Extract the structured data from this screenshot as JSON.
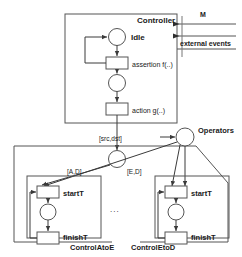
{
  "diagram": {
    "type": "hierarchical-petri-net",
    "title_visible": false,
    "colors": {
      "stroke": "#555555",
      "text": "#1a1a1a",
      "fill": "#ffffff",
      "background": "#ffffff"
    },
    "controller": {
      "box_label": "Controller",
      "places": [
        {
          "id": "idle",
          "label": "Idle",
          "shape": "circle"
        },
        {
          "id": "p2",
          "label": "",
          "shape": "circle"
        }
      ],
      "transitions": [
        {
          "id": "t-assert",
          "label": "assertion f(..)",
          "shape": "rect"
        },
        {
          "id": "t-action",
          "label": "action g(..)",
          "shape": "rect"
        }
      ]
    },
    "external": {
      "channel_top_label": "M",
      "channel_bottom_label": "external events"
    },
    "arcs": {
      "src_dst_label": "[src,dst]",
      "a_to_d_label": "[A,D]",
      "e_to_d_label": "[E,D]"
    },
    "operators": {
      "label": "Operators",
      "shape": "circle"
    },
    "mid_place": {
      "label": "",
      "shape": "circle"
    },
    "ellipsis": "...",
    "subnets": [
      {
        "id": "control-a-to-e",
        "name": "ControlAtoE",
        "start_label": "startT",
        "finish_label": "finishT",
        "place_label": ""
      },
      {
        "id": "control-e-to-d",
        "name": "ControlEtoD",
        "start_label": "startT",
        "finish_label": "finishT",
        "place_label": ""
      }
    ]
  }
}
